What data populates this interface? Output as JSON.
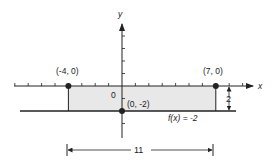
{
  "diagram": {
    "axes": {
      "x_label": "x",
      "y_label": "y",
      "origin_label": "0",
      "x_ticks_min": -8,
      "x_ticks_max": 9,
      "y_ticks_min": -3,
      "y_ticks_max": 4
    },
    "points": [
      {
        "id": "left",
        "x": -4,
        "y": 0,
        "label": "(-4, 0)"
      },
      {
        "id": "right",
        "x": 7,
        "y": 0,
        "label": "(7, 0)"
      },
      {
        "id": "intercept",
        "x": 0,
        "y": -2,
        "label": "(0, -2)"
      }
    ],
    "function_line": {
      "label": "f(x) = -2",
      "y": -2
    },
    "region": {
      "x_from": -4,
      "x_to": 7,
      "y_from": -2,
      "y_to": 0,
      "fill": "#e8e8e8"
    },
    "height_dimension": {
      "label": "2"
    },
    "width_dimension": {
      "label": "11"
    },
    "colors": {
      "line": "#222222",
      "fill": "#e6e6e6"
    }
  }
}
